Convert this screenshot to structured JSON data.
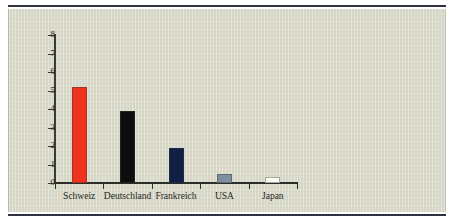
{
  "chart_data": {
    "type": "bar",
    "title": "",
    "subtitle": "",
    "xlabel": "",
    "ylabel": "",
    "categories": [
      "Schweiz",
      "Deutschland",
      "Frankreich",
      "USA",
      "Japan"
    ],
    "values": [
      5.2,
      3.9,
      1.9,
      0.5,
      0.35
    ],
    "series": [
      {
        "name": "",
        "values": [
          5.2,
          3.9,
          1.9,
          0.5,
          0.35
        ]
      }
    ],
    "bar_colors": [
      "#f0321e",
      "#0d0d0d",
      "#101f45",
      "#7e8fa3",
      "#fbfbf4"
    ],
    "ylim": [
      0,
      8
    ],
    "yticks": [
      0,
      1,
      2,
      3,
      4,
      5,
      6,
      7,
      8
    ],
    "ytick_labels": [
      "0",
      "1",
      "2",
      "3",
      "4",
      "5",
      "6",
      "7",
      "8"
    ],
    "grid": false,
    "legend": "none",
    "annotations": []
  },
  "figure": {
    "background_color": "#d8d8c8",
    "page_color": "#ffffff",
    "rule_color": "#2d3340",
    "axis_color": "#2b2b28",
    "text_color": "#262622"
  }
}
